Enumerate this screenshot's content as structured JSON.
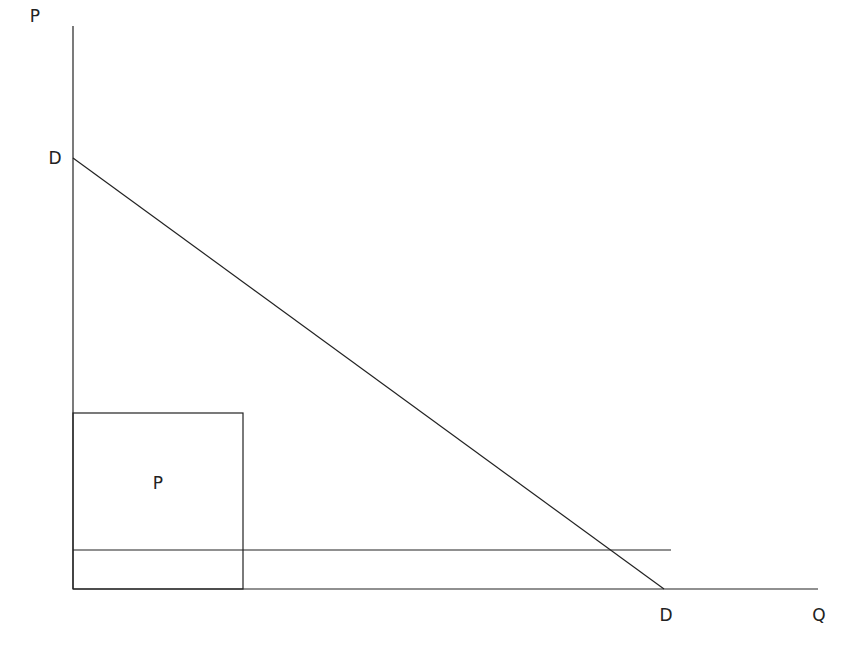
{
  "diagram": {
    "type": "supply-demand-graph",
    "labels": {
      "y_axis": "P",
      "x_axis": "Q",
      "demand_top": "D",
      "demand_bottom": "D",
      "box": "P"
    },
    "colors": {
      "line": "#222222",
      "background": "#ffffff"
    }
  }
}
